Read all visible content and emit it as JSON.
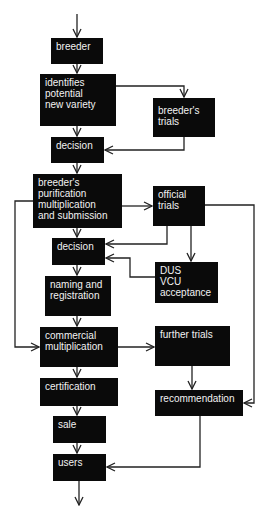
{
  "colors": {
    "box_fill": "#0a0a0a",
    "box_text": "#f2f2f2",
    "line": "#222222",
    "background": "#ffffff"
  },
  "nodes": {
    "breeder": "breeder",
    "identifies": "identifies\npotential\nnew variety",
    "breeders_trials": "breeder's\ntrials",
    "decision1": "decision",
    "purification": "breeder's\npurification\nmultiplication\nand submission",
    "official_trials": "official\ntrials",
    "decision2": "decision",
    "dus": "DUS\nVCU\nacceptance",
    "naming": "naming and\nregistration",
    "commercial": "commercial\nmultiplication",
    "further_trials": "further trials",
    "certification": "certification",
    "recommendation": "recommendation",
    "sale": "sale",
    "users": "users"
  }
}
